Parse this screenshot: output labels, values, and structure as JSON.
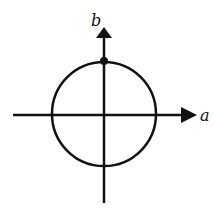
{
  "diagram": {
    "type": "phasor-circle",
    "axes": {
      "horizontal_label": "a",
      "vertical_label": "b"
    },
    "colors": {
      "stroke": "#111111",
      "background": "#ffffff"
    },
    "elements": [
      "circle centered at origin",
      "point on circle at positive b-axis intersection"
    ]
  }
}
